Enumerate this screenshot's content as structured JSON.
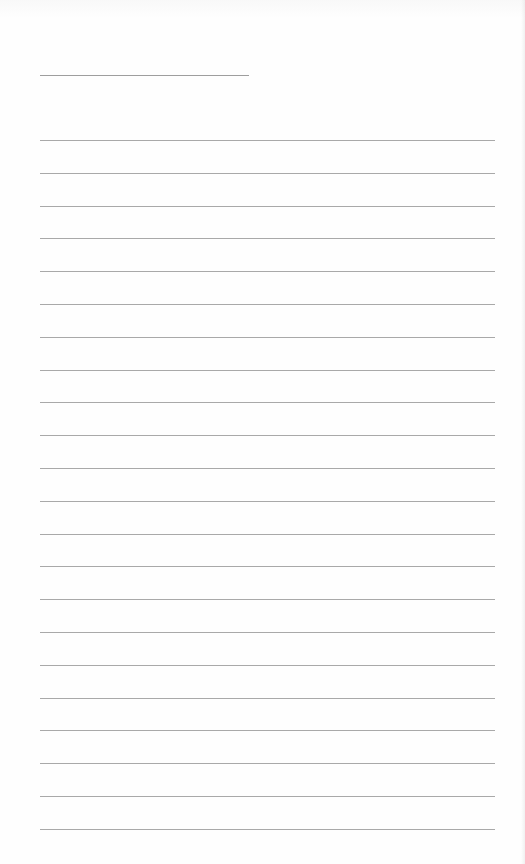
{
  "page": {
    "type": "lined-notepad",
    "background_color": "#fefefe",
    "line_color": "#a9a9a9"
  },
  "title_line": {
    "text": "",
    "left": 40,
    "top": 75,
    "width": 209
  },
  "ruled_lines": {
    "count": 22,
    "left": 40,
    "right": 495,
    "first_top": 140,
    "spacing": 32.8,
    "texts": [
      "",
      "",
      "",
      "",
      "",
      "",
      "",
      "",
      "",
      "",
      "",
      "",
      "",
      "",
      "",
      "",
      "",
      "",
      "",
      "",
      "",
      ""
    ]
  }
}
